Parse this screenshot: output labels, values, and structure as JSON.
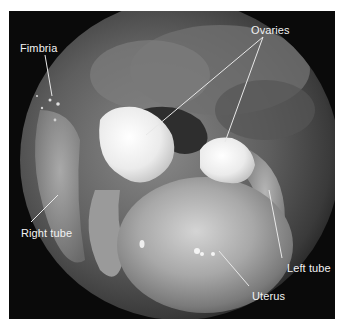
{
  "figure": {
    "type": "annotated laparoscopic photograph",
    "frame_color": "#0a0a0a",
    "labels": [
      {
        "id": "fimbria",
        "text": "Fimbria",
        "x": 20,
        "y": 42
      },
      {
        "id": "ovaries",
        "text": "Ovaries",
        "x": 251,
        "y": 24
      },
      {
        "id": "right-tube",
        "text": "Right tube",
        "x": 21,
        "y": 227
      },
      {
        "id": "left-tube",
        "text": "Left tube",
        "x": 287,
        "y": 262
      },
      {
        "id": "uterus",
        "text": "Uterus",
        "x": 252,
        "y": 290
      }
    ],
    "leader_lines": [
      {
        "label": "Fimbria",
        "from": [
          45,
          55
        ],
        "to": [
          52,
          96
        ]
      },
      {
        "label": "Ovaries",
        "from": [
          263,
          37
        ],
        "to": [
          146,
          135
        ]
      },
      {
        "label": "Ovaries",
        "from": [
          263,
          37
        ],
        "to": [
          225,
          142
        ]
      },
      {
        "label": "Right tube",
        "from": [
          31,
          222
        ],
        "to": [
          58,
          195
        ]
      },
      {
        "label": "Left tube",
        "from": [
          282,
          258
        ],
        "to": [
          269,
          190
        ]
      },
      {
        "label": "Uterus",
        "from": [
          249,
          286
        ],
        "to": [
          219,
          251
        ]
      }
    ]
  }
}
